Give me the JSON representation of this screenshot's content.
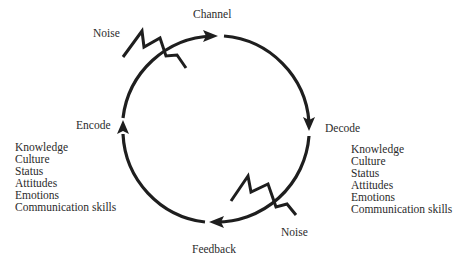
{
  "diagram": {
    "type": "communication-cycle",
    "stages": {
      "channel": "Channel",
      "decode": "Decode",
      "feedback": "Feedback",
      "encode": "Encode"
    },
    "noise_labels": {
      "top": "Noise",
      "bottom": "Noise"
    },
    "encode_factors": [
      "Knowledge",
      "Culture",
      "Status",
      "Attitudes",
      "Emotions",
      "Communication skills"
    ],
    "decode_factors": [
      "Knowledge",
      "Culture",
      "Status",
      "Attitudes",
      "Emotions",
      "Communication skills"
    ],
    "colors": {
      "stroke": "#1e1e1e",
      "text": "#2b2b2b",
      "background": "#ffffff"
    }
  }
}
